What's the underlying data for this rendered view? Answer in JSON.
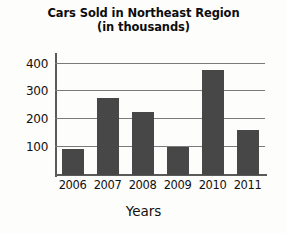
{
  "chart_data": {
    "type": "bar",
    "title": "Cars Sold in Northeast Region",
    "subtitle": "(in thousands)",
    "xlabel": "Years",
    "ylabel": "",
    "categories": [
      "2006",
      "2007",
      "2008",
      "2009",
      "2010",
      "2011"
    ],
    "values": [
      95,
      275,
      225,
      100,
      378,
      160
    ],
    "yticks": [
      100,
      200,
      300,
      400
    ],
    "ylim": [
      0,
      420
    ],
    "grid": true,
    "legend": "none",
    "bar_color": "#474747",
    "axis_color": "#5a5a5a",
    "grid_color": "#7a7a7a",
    "background_color": "#fdfdfc"
  }
}
